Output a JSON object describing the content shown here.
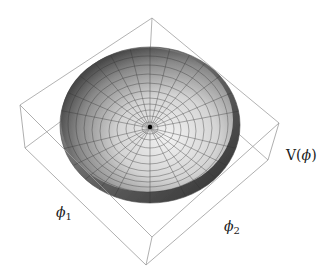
{
  "figure": {
    "axes": {
      "vertical_label": "V(ϕ)",
      "x_label_symbol": "ϕ",
      "x_label_sub": "1",
      "y_label_symbol": "ϕ",
      "y_label_sub": "2"
    },
    "colors": {
      "box_edge": "#9a9a9a",
      "surface_light": "#e8e8e8",
      "surface_dark": "#4a4a4a",
      "mesh": "#333333",
      "minimum_point": "#000000"
    }
  }
}
